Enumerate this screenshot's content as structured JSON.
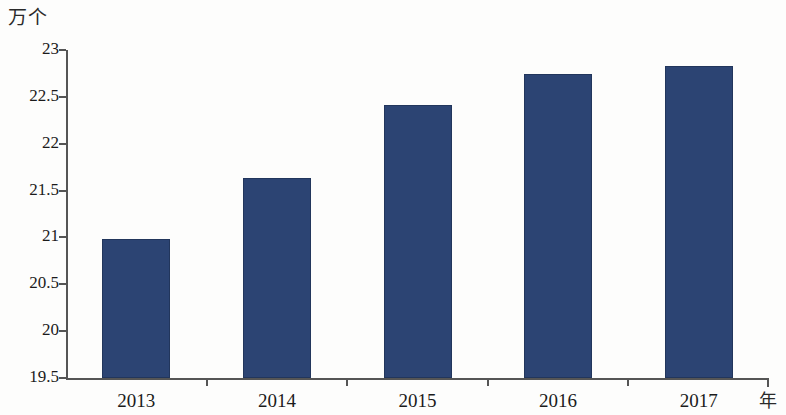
{
  "chart_data": {
    "type": "bar",
    "title": "",
    "subtitle": "",
    "xlabel": "年",
    "ylabel": "万个",
    "categories": [
      "2013",
      "2014",
      "2015",
      "2016",
      "2017"
    ],
    "values": [
      20.98,
      21.63,
      22.41,
      22.74,
      22.83
    ],
    "series": [
      {
        "name": "",
        "values": [
          20.98,
          21.63,
          22.41,
          22.74,
          22.83
        ]
      }
    ],
    "ylim": [
      19.5,
      23
    ],
    "y_ticks": [
      "19.5",
      "20",
      "20.5",
      "21",
      "21.5",
      "22",
      "22.5",
      "23"
    ],
    "y_tick_values": [
      19.5,
      20,
      20.5,
      21,
      21.5,
      22,
      22.5,
      23
    ],
    "grid": false,
    "legend": false,
    "legend_position": "none",
    "bar_color": "#2c4473",
    "axis_color": "#555555",
    "background_color": "#fdfdfc"
  }
}
